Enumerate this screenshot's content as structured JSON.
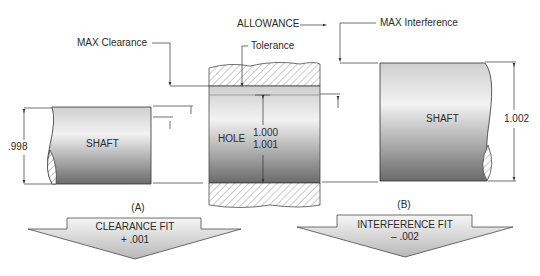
{
  "labels": {
    "allowance": "ALLOWANCE",
    "max_clearance": "MAX Clearance",
    "tolerance": "Tolerance",
    "max_interference": "MAX Interference"
  },
  "shaft_a": {
    "label": "SHAFT",
    "dimension": ".998"
  },
  "hole": {
    "label": "HOLE",
    "dim_min": "1.000",
    "dim_max": "1.001"
  },
  "shaft_b": {
    "label": "SHAFT",
    "dimension": "1.002"
  },
  "fit_a": {
    "caption": "(A)",
    "title": "CLEARANCE FIT",
    "value": "+ .001"
  },
  "fit_b": {
    "caption": "(B)",
    "title": "INTERFERENCE FIT",
    "value": "– .002"
  },
  "colors": {
    "line": "#333333",
    "shade_dark": "#6a6a6a",
    "shade_light": "#f4f4f4"
  }
}
